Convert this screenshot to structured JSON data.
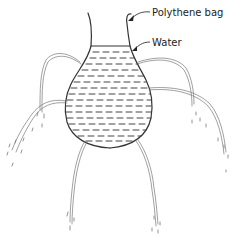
{
  "diagram": {
    "labels": [
      {
        "id": "bag",
        "text": "Polythene bag",
        "x": 152,
        "y": 9
      },
      {
        "id": "water",
        "text": "Water",
        "x": 152,
        "y": 39
      }
    ],
    "colors": {
      "stroke": "#333333",
      "jet": "#777777",
      "water_dash": "#444444"
    }
  }
}
